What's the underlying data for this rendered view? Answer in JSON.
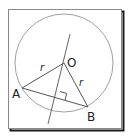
{
  "diagram": {
    "frame": {
      "x": 8,
      "y": 9,
      "width": 113,
      "height": 119,
      "border_color": "#8a8a8a",
      "shadow_color": "#1a1a1a"
    },
    "circle": {
      "cx": 64,
      "cy": 63,
      "r": 49,
      "stroke": "#9a9a9a"
    },
    "points": {
      "O": {
        "label": "O",
        "x": 64,
        "y": 63,
        "label_x": 68,
        "label_y": 66
      },
      "A": {
        "label": "A",
        "x": 22,
        "y": 88,
        "label_x": 12,
        "label_y": 98
      },
      "B": {
        "label": "B",
        "x": 88,
        "y": 107,
        "label_x": 88,
        "label_y": 121
      }
    },
    "segments": [
      {
        "name": "OA",
        "from": "O",
        "to": "A",
        "label": "r",
        "label_x": 41,
        "label_y": 71
      },
      {
        "name": "OB",
        "from": "O",
        "to": "B",
        "label": "r",
        "label_x": 80,
        "label_y": 85
      },
      {
        "name": "AB",
        "from": "A",
        "to": "B",
        "label": ""
      }
    ],
    "bisector": {
      "x1": 70,
      "y1": 34,
      "x2": 48,
      "y2": 124
    },
    "right_angle_marker": {
      "at": "foot of perpendicular on AB",
      "size": 7
    },
    "line_color": "#555555"
  }
}
